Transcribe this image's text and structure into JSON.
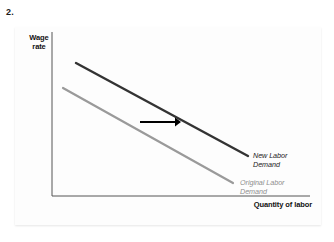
{
  "question": {
    "number": "2."
  },
  "figure": {
    "axes": {
      "y_label": "Wage\nrate",
      "y_label_line1": "Wage",
      "y_label_line2": "rate",
      "x_label": "Quantity of labor"
    },
    "curves": [
      {
        "id": "original-labor-demand",
        "label_line1": "Original Labor",
        "label_line2": "Demand",
        "color": "#9a9a9a",
        "x1": 63,
        "y1": 88,
        "x2": 233,
        "y2": 183
      },
      {
        "id": "new-labor-demand",
        "label_line1": "New Labor",
        "label_line2": "Demand",
        "color": "#333333",
        "x1": 76,
        "y1": 63,
        "x2": 248,
        "y2": 156
      }
    ],
    "arrow": {
      "label": "shift-right-arrow",
      "color": "#000000",
      "x1": 140,
      "y1": 122,
      "x2": 181,
      "y2": 122
    },
    "axis_color": "#555555"
  },
  "chart_data": {
    "type": "line",
    "title": "",
    "xlabel": "Quantity of labor",
    "ylabel": "Wage rate",
    "xlim": [
      0,
      100
    ],
    "ylim": [
      0,
      100
    ],
    "grid": false,
    "legend": "inline-annotations",
    "annotations": [
      "Original Labor Demand",
      "New Labor Demand"
    ],
    "series": [
      {
        "name": "Original Labor Demand",
        "color": "#9a9a9a",
        "x": [
          4,
          70
        ],
        "y": [
          66,
          8
        ]
      },
      {
        "name": "New Labor Demand",
        "color": "#333333",
        "x": [
          9,
          76
        ],
        "y": [
          81,
          24
        ]
      }
    ]
  }
}
